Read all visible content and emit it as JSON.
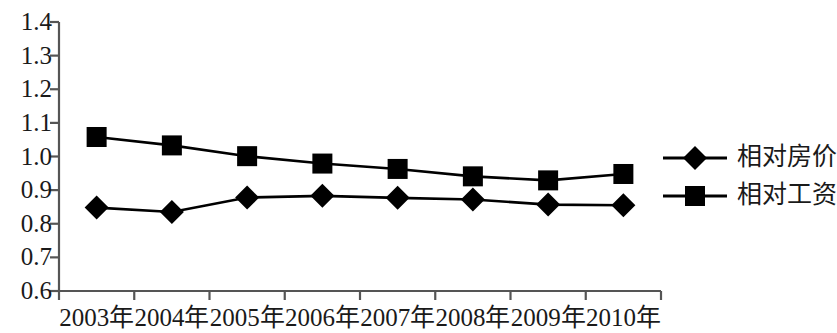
{
  "chart_data": {
    "type": "line",
    "title": "",
    "xlabel": "",
    "ylabel": "",
    "categories": [
      "2003年",
      "2004年",
      "2005年",
      "2006年",
      "2007年",
      "2008年",
      "2009年",
      "2010年"
    ],
    "ylim": [
      0.6,
      1.4
    ],
    "ytick_labels": [
      "1.4",
      "1.3",
      "1.2",
      "1.1",
      "1.0",
      "0.9",
      "0.8",
      "0.7",
      "0.6"
    ],
    "ytick_values": [
      1.4,
      1.3,
      1.2,
      1.1,
      1.0,
      0.9,
      0.8,
      0.7,
      0.6
    ],
    "grid": false,
    "legend_position": "right",
    "series": [
      {
        "name": "相对房价",
        "marker": "diamond",
        "color": "#000000",
        "values": [
          0.848,
          0.835,
          0.878,
          0.883,
          0.877,
          0.872,
          0.857,
          0.855
        ]
      },
      {
        "name": "相对工资",
        "marker": "square",
        "color": "#000000",
        "values": [
          1.058,
          1.033,
          1.001,
          0.979,
          0.963,
          0.941,
          0.929,
          0.948
        ]
      }
    ]
  },
  "legend": {
    "items": [
      {
        "label": "相对房价",
        "marker": "diamond"
      },
      {
        "label": "相对工资",
        "marker": "square"
      }
    ]
  },
  "axes": {
    "line_color": "#555555",
    "series_color": "#000000"
  }
}
